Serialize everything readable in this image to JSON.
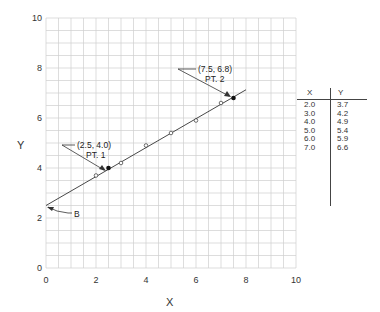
{
  "chart_data": {
    "type": "scatter",
    "title": "",
    "xlabel": "X",
    "ylabel": "Y",
    "xlim": [
      0,
      10
    ],
    "ylim": [
      0,
      10
    ],
    "grid": true,
    "grid_step": 0.5,
    "x_ticks": [
      "0",
      "2",
      "4",
      "6",
      "8",
      "10"
    ],
    "y_ticks": [
      "0",
      "2",
      "4",
      "6",
      "8",
      "10"
    ],
    "series": [
      {
        "name": "data points",
        "x": [
          2.0,
          3.0,
          4.0,
          5.0,
          6.0,
          7.0
        ],
        "y": [
          3.7,
          4.2,
          4.9,
          5.4,
          5.9,
          6.6
        ],
        "marker": "open-circle"
      },
      {
        "name": "fit line",
        "type": "line",
        "x": [
          0,
          8
        ],
        "y": [
          2.5,
          7.13
        ]
      },
      {
        "name": "selected points",
        "x": [
          2.5,
          7.5
        ],
        "y": [
          4.0,
          6.8
        ],
        "marker": "filled-circle"
      }
    ],
    "annotations": [
      {
        "text": "(2.5, 4.0)",
        "sub": "PT. 1",
        "x": 2.5,
        "y": 4.0
      },
      {
        "text": "(7.5, 6.8)",
        "sub": "PT. 2",
        "x": 7.5,
        "y": 6.8
      },
      {
        "text": "B",
        "x": 0,
        "y": 2.5
      }
    ],
    "table": {
      "headers": [
        "X",
        "Y"
      ],
      "rows": [
        [
          "2.0",
          "3.7"
        ],
        [
          "3.0",
          "4.2"
        ],
        [
          "4.0",
          "4.9"
        ],
        [
          "5.0",
          "5.4"
        ],
        [
          "6.0",
          "5.9"
        ],
        [
          "7.0",
          "6.6"
        ]
      ]
    }
  },
  "labels": {
    "x_axis": "X",
    "y_axis": "Y",
    "pt1_coords": "(2.5, 4.0)",
    "pt1_name": "PT. 1",
    "pt2_coords": "(7.5, 6.8)",
    "pt2_name": "PT. 2",
    "intercept": "B"
  },
  "table": {
    "header_x": "X",
    "header_y": "Y",
    "rows": [
      {
        "x": "2.0",
        "y": "3.7"
      },
      {
        "x": "3.0",
        "y": "4.2"
      },
      {
        "x": "4.0",
        "y": "4.9"
      },
      {
        "x": "5.0",
        "y": "5.4"
      },
      {
        "x": "6.0",
        "y": "5.9"
      },
      {
        "x": "7.0",
        "y": "6.6"
      }
    ]
  },
  "colors": {
    "grid": "#cfcfcf",
    "ink": "#333333"
  }
}
